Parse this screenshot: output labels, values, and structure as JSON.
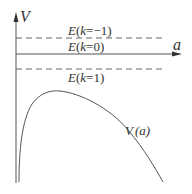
{
  "diagram": {
    "axes": {
      "y_label": "V",
      "x_label": "a"
    },
    "levels": [
      {
        "label_E": "E",
        "label_open": "(",
        "label_k": "k",
        "label_rest": "=−1)",
        "style": "dashed"
      },
      {
        "label_E": "E",
        "label_open": "(",
        "label_k": "k",
        "label_rest": "=0)",
        "style": "solid"
      },
      {
        "label_E": "E",
        "label_open": "(",
        "label_k": "k",
        "label_rest": "=1)",
        "style": "dashed"
      }
    ],
    "curve": {
      "label_V": "V",
      "label_arg": "(a)"
    },
    "colors": {
      "line": "#555555",
      "text": "#333333"
    }
  }
}
